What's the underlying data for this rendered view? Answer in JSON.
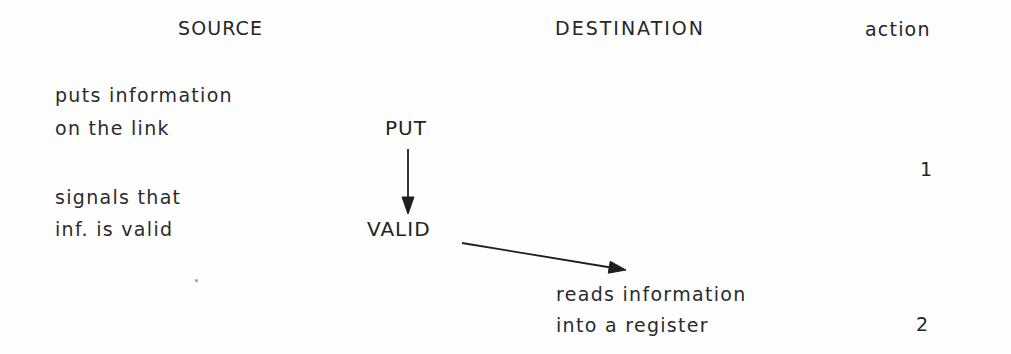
{
  "page": {
    "kind": "scanned-diagram",
    "background_color": "#fefefe",
    "ink_color": "#2a2a2a",
    "width": 1011,
    "height": 354
  },
  "headers": {
    "source": "SOURCE",
    "destination": "DESTINATION",
    "action": "action"
  },
  "source": {
    "step1": {
      "line1": "puts information",
      "line2": "on the link"
    },
    "step2": {
      "line1": "signals that",
      "line2": "inf. is valid"
    }
  },
  "signals": {
    "put": "PUT",
    "valid": "VALID"
  },
  "destination": {
    "step1": {
      "line1": "reads information",
      "line2": "into a register"
    }
  },
  "actions": {
    "first": "1",
    "second": "2"
  },
  "arrows": {
    "put_to_valid": {
      "name": "vertical-arrow",
      "from_x": 408,
      "from_y": 149,
      "to_x": 408,
      "to_y": 214
    },
    "valid_to_reads": {
      "name": "diagonal-arrow",
      "from_x": 462,
      "from_y": 243,
      "to_x": 626,
      "to_y": 270
    }
  }
}
